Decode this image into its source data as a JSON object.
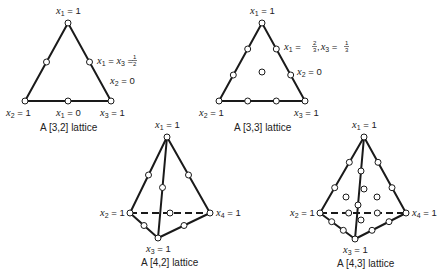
{
  "diagrams": [
    {
      "id": "lattice-3-2",
      "caption": "A [3,2] lattice",
      "labels": {
        "top": "x1 = 1",
        "bottom_left": "x2 = 1",
        "bottom_mid": "x1 = 0",
        "bottom_right": "x3 = 1",
        "right_edge_point": "x1 = x3 = 1/2",
        "right_edge": "x2 = 0"
      }
    },
    {
      "id": "lattice-3-3",
      "caption": "A [3,3] lattice",
      "labels": {
        "top": "x1 = 1",
        "bottom_left": "x2 = 1",
        "bottom_right": "x3 = 1",
        "right_edge_point": "x1 = 2/3, x3 = 1/3",
        "right_edge": "x2 = 0"
      }
    },
    {
      "id": "lattice-4-2",
      "caption": "A [4,2] lattice",
      "labels": {
        "top": "x1 = 1",
        "left": "x2 = 1",
        "right": "x4 = 1",
        "bottom": "x3 = 1"
      }
    },
    {
      "id": "lattice-4-3",
      "caption": "A [4,3] lattice",
      "labels": {
        "top": "x1 = 1",
        "left": "x2 = 1",
        "right": "x4 = 1",
        "bottom": "x3 = 1"
      }
    }
  ],
  "text": {
    "x": "x",
    "eq1": " = 1",
    "eq0": " = 0",
    "eq": " = ",
    "s1": "1",
    "s2": "2",
    "s3": "3",
    "s4": "4",
    "half_num": "1",
    "half_den": "2",
    "third_num": "1",
    "third_den": "3",
    "twothird_num": "2",
    "twothird_den": "3",
    "comma": ",",
    "cap32": "A [3,2] lattice",
    "cap33": "A [3,3] lattice",
    "cap42": "A [4,2] lattice",
    "cap43": "A [4,3] lattice"
  },
  "colors": {
    "stroke": "#1a1a1a",
    "background": "#ffffff"
  }
}
